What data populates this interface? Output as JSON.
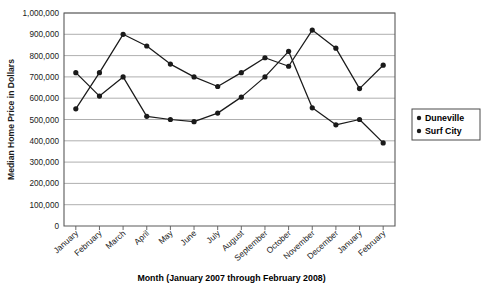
{
  "chart_data": {
    "type": "line",
    "title": "",
    "xlabel": "Month (January 2007 through February 2008)",
    "ylabel": "Median Home Price in Dollars",
    "categories": [
      "January",
      "February",
      "March",
      "April",
      "May",
      "June",
      "July",
      "August",
      "September",
      "October",
      "November",
      "December",
      "January",
      "February"
    ],
    "ylim": [
      0,
      1000000
    ],
    "ytick_values": [
      0,
      100000,
      200000,
      300000,
      400000,
      500000,
      600000,
      700000,
      800000,
      900000,
      1000000
    ],
    "ytick_labels": [
      "0",
      "100,000",
      "200,000",
      "300,000",
      "400,000",
      "500,000",
      "600,000",
      "700,000",
      "800,000",
      "900,000",
      "1,000,000"
    ],
    "grid": true,
    "legend_position": "right",
    "series": [
      {
        "name": "Duneville",
        "color": "#1a1a1a",
        "values": [
          550000,
          720000,
          900000,
          845000,
          760000,
          700000,
          655000,
          720000,
          790000,
          750000,
          920000,
          835000,
          645000,
          755000
        ]
      },
      {
        "name": "Surf City",
        "color": "#1a1a1a",
        "values": [
          720000,
          610000,
          700000,
          515000,
          500000,
          490000,
          530000,
          605000,
          700000,
          820000,
          555000,
          475000,
          500000,
          390000
        ]
      }
    ]
  },
  "axis": {
    "y_title": "Median Home Price in Dollars",
    "x_title": "Month (January 2007 through February 2008)"
  },
  "legend": {
    "entries": [
      {
        "label": "Duneville"
      },
      {
        "label": "Surf City"
      }
    ]
  }
}
